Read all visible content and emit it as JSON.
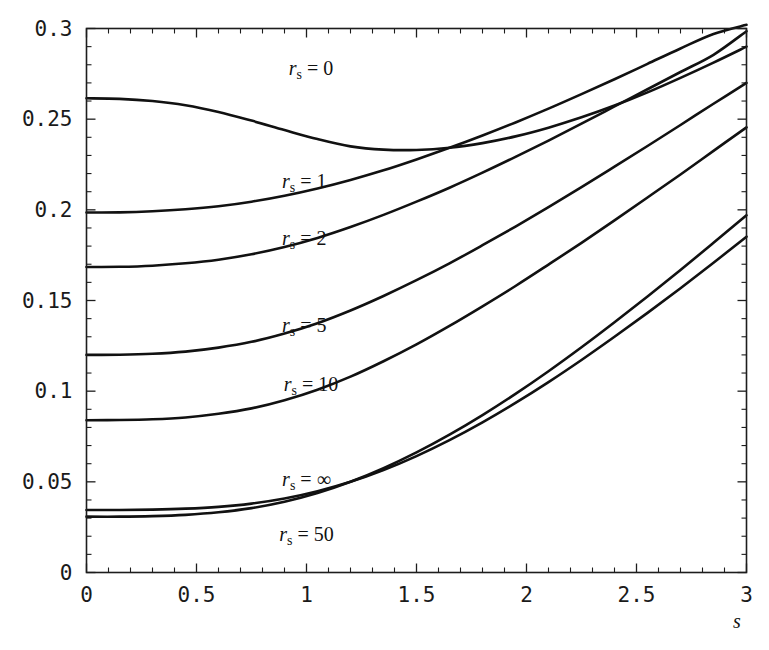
{
  "chart_data": {
    "type": "line",
    "title": "",
    "xlabel": "s",
    "ylabel": "",
    "xlim": [
      0,
      3
    ],
    "ylim": [
      0,
      0.3
    ],
    "grid": false,
    "legend_position": "inline-curve-labels",
    "x_ticks": [
      "0",
      "0.5",
      "1",
      "1.5",
      "2",
      "2.5",
      "3"
    ],
    "x_tick_values": [
      0,
      0.5,
      1,
      1.5,
      2,
      2.5,
      3
    ],
    "y_ticks": [
      "0",
      "0.05",
      "0.1",
      "0.15",
      "0.2",
      "0.25",
      "0.3"
    ],
    "y_tick_values": [
      0,
      0.05,
      0.1,
      0.15,
      0.2,
      0.25,
      0.3
    ],
    "x": [
      0,
      0.15,
      0.3,
      0.45,
      0.6,
      0.75,
      0.9,
      1.05,
      1.2,
      1.35,
      1.5,
      1.65,
      1.8,
      1.95,
      2.1,
      2.25,
      2.4,
      2.55,
      2.7,
      2.85,
      3
    ],
    "series": [
      {
        "name": "r_s = 0",
        "label_main": "r",
        "label_sub": "s",
        "label_eq": "=",
        "label_value": "0",
        "label_x": 1.02,
        "label_y": 0.2745,
        "values": [
          0.2615,
          0.2612,
          0.26,
          0.2577,
          0.254,
          0.2492,
          0.244,
          0.239,
          0.235,
          0.2332,
          0.233,
          0.2342,
          0.2368,
          0.2405,
          0.2453,
          0.251,
          0.2575,
          0.2648,
          0.2728,
          0.2812,
          0.29
        ]
      },
      {
        "name": "r_s = 1",
        "label_main": "r",
        "label_sub": "s",
        "label_eq": "=",
        "label_value": "1",
        "label_x": 0.99,
        "label_y": 0.2122,
        "values": [
          0.1985,
          0.1986,
          0.1992,
          0.2003,
          0.202,
          0.2045,
          0.2078,
          0.2118,
          0.2165,
          0.2218,
          0.2278,
          0.2342,
          0.241,
          0.2482,
          0.2558,
          0.2638,
          0.272,
          0.2805,
          0.289,
          0.297,
          0.302
        ]
      },
      {
        "name": "r_s = 2",
        "label_main": "r",
        "label_sub": "s",
        "label_eq": "=",
        "label_value": "2",
        "label_x": 0.99,
        "label_y": 0.1805,
        "values": [
          0.1685,
          0.1686,
          0.1692,
          0.1705,
          0.1725,
          0.1755,
          0.1795,
          0.1845,
          0.1905,
          0.1972,
          0.2045,
          0.2122,
          0.2205,
          0.2292,
          0.2382,
          0.2475,
          0.257,
          0.2665,
          0.276,
          0.2855,
          0.2985
        ]
      },
      {
        "name": "r_s = 5",
        "label_main": "r",
        "label_sub": "s",
        "label_eq": "=",
        "label_value": "5",
        "label_x": 0.99,
        "label_y": 0.1328,
        "values": [
          0.12,
          0.1201,
          0.1206,
          0.1218,
          0.124,
          0.1272,
          0.1318,
          0.1375,
          0.1445,
          0.1525,
          0.1612,
          0.1705,
          0.1805,
          0.1908,
          0.2015,
          0.2125,
          0.2238,
          0.2352,
          0.2468,
          0.2585,
          0.27
        ]
      },
      {
        "name": "r_s = 10",
        "label_main": "r",
        "label_sub": "s",
        "label_eq": "=",
        "label_value": "10",
        "label_x": 1.02,
        "label_y": 0.1002,
        "values": [
          0.084,
          0.0841,
          0.0845,
          0.0855,
          0.0875,
          0.0905,
          0.095,
          0.1008,
          0.108,
          0.1165,
          0.1258,
          0.136,
          0.1468,
          0.158,
          0.1698,
          0.1818,
          0.1942,
          0.2068,
          0.2195,
          0.2325,
          0.2455
        ]
      },
      {
        "name": "r_s = ∞",
        "label_main": "r",
        "label_sub": "s",
        "label_eq": "=",
        "label_value": "∞",
        "label_x": 1.0,
        "label_y": 0.0478,
        "values": [
          0.0345,
          0.0345,
          0.0347,
          0.0352,
          0.0362,
          0.038,
          0.0408,
          0.0448,
          0.05,
          0.0565,
          0.0642,
          0.073,
          0.0828,
          0.0935,
          0.105,
          0.1172,
          0.13,
          0.1432,
          0.1568,
          0.1708,
          0.1852
        ]
      },
      {
        "name": "r_s = 50",
        "label_main": "r",
        "label_sub": "s",
        "label_eq": "=",
        "label_value": "50",
        "label_x": 1.0,
        "label_y": 0.0172,
        "values": [
          0.0308,
          0.0308,
          0.0311,
          0.0318,
          0.0332,
          0.0355,
          0.039,
          0.0438,
          0.05,
          0.0575,
          0.0662,
          0.076,
          0.0868,
          0.0985,
          0.111,
          0.1242,
          0.138,
          0.1522,
          0.1668,
          0.1818,
          0.197
        ]
      }
    ]
  }
}
